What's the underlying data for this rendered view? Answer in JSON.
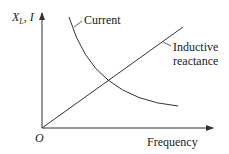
{
  "diagram": {
    "y_axis_label_main": "X",
    "y_axis_label_sub": "L",
    "y_axis_label_rest": ", I",
    "x_axis_label": "Frequency",
    "origin_label": "O",
    "curves": [
      {
        "name": "Current",
        "label": "Current",
        "shape": "decreasing hyperbola"
      },
      {
        "name": "Inductive reactance",
        "label_line1": "Inductive",
        "label_line2": "reactance",
        "shape": "increasing straight line from origin"
      }
    ],
    "colors": {
      "stroke": "#333333",
      "background": "#ffffff"
    }
  }
}
